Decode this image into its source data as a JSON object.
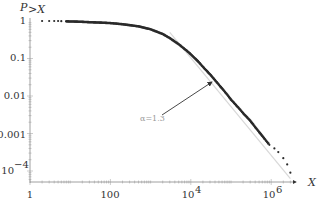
{
  "chart_data": {
    "type": "scatter",
    "title": "",
    "xlabel": "X",
    "ylabel": "P>X",
    "xscale": "log",
    "yscale": "log",
    "xlim": [
      1,
      4000000
    ],
    "ylim": [
      5e-05,
      1.3
    ],
    "grid": false,
    "legend": null,
    "x_ticks": [
      {
        "value": 1,
        "label": "1"
      },
      {
        "value": 100,
        "label": "100"
      },
      {
        "value": 10000,
        "label": "10^4"
      },
      {
        "value": 1000000,
        "label": "10^6"
      }
    ],
    "y_ticks": [
      {
        "value": 1,
        "label": "1"
      },
      {
        "value": 0.1,
        "label": "0.1"
      },
      {
        "value": 0.01,
        "label": "0.01"
      },
      {
        "value": 0.001,
        "label": "0.001"
      },
      {
        "value": 0.0001,
        "label": "10^-4"
      }
    ],
    "series": [
      {
        "name": "empirical CCDF",
        "style": "points",
        "x": [
          2,
          3,
          4,
          5,
          6,
          8,
          10,
          15,
          20,
          30,
          50,
          100,
          200,
          500,
          1000,
          2000,
          3000,
          5000,
          8000,
          10000,
          15000,
          20000,
          30000,
          50000,
          80000,
          100000,
          150000,
          200000,
          300000,
          500000,
          700000,
          900000,
          1200000,
          1500000,
          2000000,
          2500000,
          3000000
        ],
        "y": [
          1,
          1,
          1,
          1,
          0.99,
          0.98,
          0.97,
          0.96,
          0.95,
          0.93,
          0.91,
          0.88,
          0.82,
          0.72,
          0.6,
          0.45,
          0.35,
          0.24,
          0.16,
          0.13,
          0.085,
          0.06,
          0.038,
          0.02,
          0.011,
          0.008,
          0.005,
          0.0035,
          0.0022,
          0.0011,
          0.0007,
          0.0005,
          0.0004,
          0.00032,
          0.00022,
          0.00015,
          9e-05
        ]
      },
      {
        "name": "power-law fit",
        "style": "line",
        "exponent": 1.3,
        "x": [
          3000,
          3000000
        ],
        "y": [
          0.5,
          6.3e-05
        ]
      }
    ],
    "annotations": [
      {
        "text": "α=1.3",
        "x": 300,
        "y": 0.003,
        "arrow_to": {
          "x": 22000,
          "y": 0.045
        }
      }
    ]
  },
  "labels": {
    "y_axis_title": "P",
    "y_axis_subscript": ">X",
    "x_axis_title": "X",
    "annotation": "α=1.3",
    "x_tick_1": "1",
    "x_tick_100": "100",
    "x_tick_1e4_base": "10",
    "x_tick_1e4_exp": "4",
    "x_tick_1e6_base": "10",
    "x_tick_1e6_exp": "6",
    "y_tick_1": "1",
    "y_tick_01": "0.1",
    "y_tick_001": "0.01",
    "y_tick_0001": "0.001",
    "y_tick_1e4_base": "10",
    "y_tick_1e4_exp": "−4"
  }
}
